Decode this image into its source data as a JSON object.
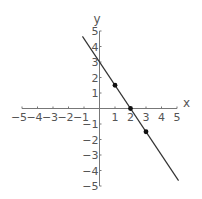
{
  "chart_data": {
    "type": "line",
    "title": "",
    "xlabel": "x",
    "ylabel": "y",
    "xlim": [
      -5,
      5
    ],
    "ylim": [
      -5,
      5
    ],
    "grid": false,
    "x_ticks": [
      -5,
      -4,
      -3,
      -2,
      -1,
      1,
      2,
      3,
      4,
      5
    ],
    "y_ticks": [
      -5,
      -4,
      -3,
      -2,
      -1,
      1,
      2,
      3,
      4,
      5
    ],
    "series": [
      {
        "name": "line",
        "equation": "y = -1.5x + 3",
        "x": [
          -1.1,
          5.1
        ],
        "y": [
          4.65,
          -4.65
        ],
        "color": "#333333"
      }
    ],
    "points": [
      {
        "x": 1,
        "y": 1.5
      },
      {
        "x": 2,
        "y": 0
      },
      {
        "x": 3,
        "y": -1.5
      }
    ]
  },
  "labels": {
    "x_axis": "x",
    "y_axis": "y"
  }
}
